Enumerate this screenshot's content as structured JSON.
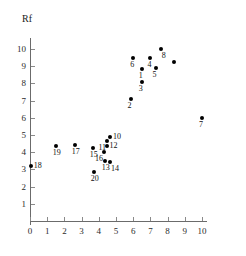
{
  "chart_data": {
    "type": "scatter",
    "title": "",
    "xlabel": "",
    "ylabel": "Rf",
    "xlim": [
      0,
      10.3
    ],
    "ylim": [
      0,
      10.4
    ],
    "xticks": [
      "0",
      "1",
      "2",
      "3",
      "4",
      "5",
      "6",
      "7",
      "8",
      "9",
      "10"
    ],
    "yticks": [
      "1",
      "2",
      "3",
      "4",
      "5",
      "6",
      "7",
      "8",
      "9",
      "10"
    ],
    "grid": false,
    "legend": "none",
    "marker": "filled-circle",
    "marker_color": "#000000",
    "points": [
      {
        "label": "18",
        "x": 0.05,
        "y": 3.2,
        "label_pos": "right"
      },
      {
        "label": "19",
        "x": 1.5,
        "y": 4.35,
        "label_pos": "below"
      },
      {
        "label": "17",
        "x": 2.6,
        "y": 4.4,
        "label_pos": "below"
      },
      {
        "label": "15",
        "x": 3.65,
        "y": 4.25,
        "label_pos": "below"
      },
      {
        "label": "20",
        "x": 3.7,
        "y": 2.85,
        "label_pos": "below"
      },
      {
        "label": "16",
        "x": 4.3,
        "y": 4.0,
        "label_pos": "below-left"
      },
      {
        "label": "13",
        "x": 4.35,
        "y": 3.5,
        "label_pos": "below"
      },
      {
        "label": "12",
        "x": 4.45,
        "y": 4.35,
        "label_pos": "right"
      },
      {
        "label": "11",
        "x": 4.5,
        "y": 4.65,
        "label_pos": "below-left"
      },
      {
        "label": "10",
        "x": 4.65,
        "y": 4.9,
        "label_pos": "right"
      },
      {
        "label": "14",
        "x": 4.65,
        "y": 3.45,
        "label_pos": "below-right"
      },
      {
        "label": "2",
        "x": 5.85,
        "y": 7.1,
        "label_pos": "below"
      },
      {
        "label": "6",
        "x": 6.0,
        "y": 9.5,
        "label_pos": "below"
      },
      {
        "label": "1",
        "x": 6.5,
        "y": 8.85,
        "label_pos": "below"
      },
      {
        "label": "3",
        "x": 6.5,
        "y": 8.1,
        "label_pos": "below"
      },
      {
        "label": "4",
        "x": 7.0,
        "y": 9.5,
        "label_pos": "below"
      },
      {
        "label": "5",
        "x": 7.3,
        "y": 8.9,
        "label_pos": "below"
      },
      {
        "label": "8",
        "x": 7.6,
        "y": 10.0,
        "label_pos": "below-right"
      },
      {
        "label": "",
        "x": 8.35,
        "y": 9.25,
        "label_pos": "below"
      },
      {
        "label": "7",
        "x": 10.0,
        "y": 6.0,
        "label_pos": "below"
      }
    ]
  }
}
